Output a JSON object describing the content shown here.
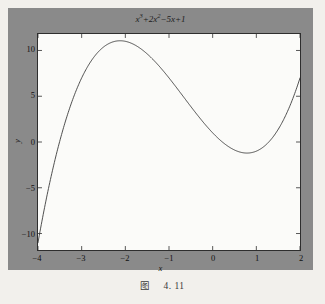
{
  "figure": {
    "caption_label": "图",
    "caption_number": "4. 11",
    "panel_color": "#8a8a8a",
    "axes_bg_color": "#fbfbf9",
    "curve_color": "#3a3a3a"
  },
  "chart_data": {
    "type": "line",
    "title_parts": {
      "base1": "x",
      "exp1": "3",
      "mid": "+2",
      "base2": "x",
      "exp2": "2",
      "tail": "−5x+1"
    },
    "xlabel": "x",
    "ylabel": "y",
    "grid": false,
    "legend": null,
    "xlim": [
      -4,
      2
    ],
    "ylim": [
      -11.8,
      11.8
    ],
    "xticks": [
      -4,
      -3,
      -2,
      -1,
      0,
      1,
      2
    ],
    "xticklabels": [
      "−4",
      "−3",
      "−2",
      "−1",
      "0",
      "1",
      "2"
    ],
    "yticks": [
      -10,
      -5,
      0,
      5,
      10
    ],
    "yticklabels": [
      "−10",
      "−5",
      "0",
      "5",
      "10"
    ],
    "equation": "y = x^3 + 2x^2 - 5x + 1",
    "annotations": {
      "local_max": {
        "x": -2.12,
        "y": 11.06
      },
      "local_min": {
        "x": 0.79,
        "y": -1.13
      },
      "endpoint_left": {
        "x": -4,
        "y": -11
      },
      "endpoint_right": {
        "x": 2,
        "y": 7
      }
    },
    "x": [
      -4,
      -3.8,
      -3.6,
      -3.4,
      -3.2,
      -3,
      -2.8,
      -2.6,
      -2.4,
      -2.2,
      -2,
      -1.8,
      -1.6,
      -1.4,
      -1.2,
      -1,
      -0.8,
      -0.6,
      -0.4,
      -0.2,
      0,
      0.2,
      0.4,
      0.6,
      0.8,
      1,
      1.2,
      1.4,
      1.6,
      1.8,
      2
    ],
    "values": [
      -11,
      -5.99,
      -1.66,
      2.02,
      5.09,
      7.6,
      9.59,
      12,
      12.26,
      13.03,
      11,
      10.65,
      10.02,
      9.18,
      8.15,
      7,
      5.77,
      4.5,
      3.26,
      2.07,
      1,
      0.088,
      -0.616,
      -1.064,
      -1.208,
      -1,
      -0.392,
      0.664,
      2.216,
      4.312,
      7
    ],
    "_values_note": "true cubic f(x)=x^3+2x^2-5x+1 sampled at the x values above"
  }
}
